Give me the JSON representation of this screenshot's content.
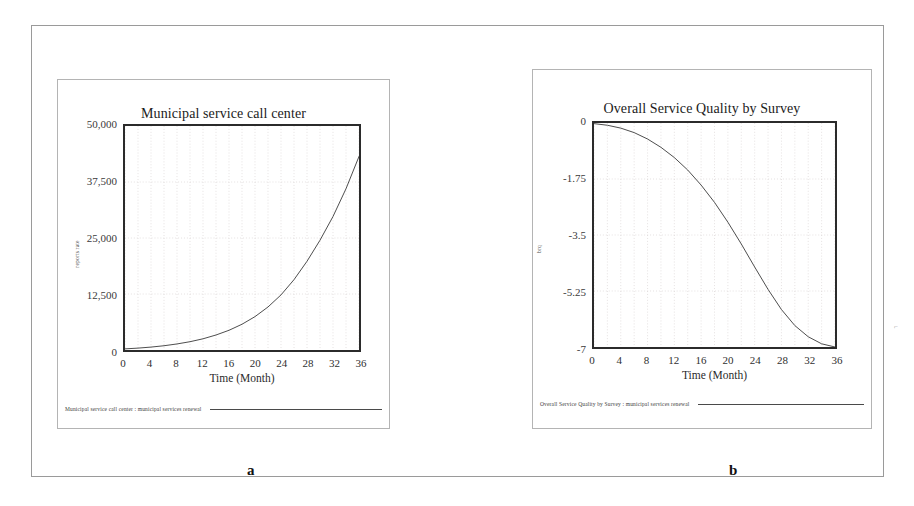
{
  "figure": {
    "caption_a": "a",
    "caption_b": "b",
    "speck": "⌐"
  },
  "chart_data": [
    {
      "id": "a",
      "type": "line",
      "title": "Municipal service call center",
      "xlabel": "Time (Month)",
      "ylabel": "reports rate",
      "legend": "Municipal service call center : municipal services renewal",
      "xlim": [
        0,
        36
      ],
      "ylim": [
        0,
        50000
      ],
      "xticks": [
        "0",
        "4",
        "8",
        "12",
        "16",
        "20",
        "24",
        "28",
        "32",
        "36"
      ],
      "xtick_values": [
        0,
        4,
        8,
        12,
        16,
        20,
        24,
        28,
        32,
        36
      ],
      "yticks": [
        "0",
        "12,500",
        "25,000",
        "37,500",
        "50,000"
      ],
      "ytick_values": [
        0,
        12500,
        25000,
        37500,
        50000
      ],
      "grid": true,
      "legend_position": "below-axes",
      "series": [
        {
          "name": "municipal services renewal",
          "color": "#3a3a3a",
          "x": [
            0,
            2,
            4,
            6,
            8,
            10,
            12,
            14,
            16,
            18,
            20,
            22,
            24,
            26,
            28,
            30,
            32,
            34,
            36
          ],
          "values": [
            250,
            420,
            650,
            950,
            1350,
            1850,
            2500,
            3350,
            4400,
            5750,
            7450,
            9600,
            12300,
            15700,
            19800,
            24500,
            29800,
            36000,
            43200
          ]
        }
      ]
    },
    {
      "id": "b",
      "type": "line",
      "title": "Overall Service Quality by Survey",
      "xlabel": "Time (Month)",
      "ylabel": "brq",
      "legend": "Overall Service Quality by Survey : municipal services renewal",
      "xlim": [
        0,
        36
      ],
      "ylim": [
        -7,
        0
      ],
      "xticks": [
        "0",
        "4",
        "8",
        "12",
        "16",
        "20",
        "24",
        "28",
        "32",
        "36"
      ],
      "xtick_values": [
        0,
        4,
        8,
        12,
        16,
        20,
        24,
        28,
        32,
        36
      ],
      "yticks": [
        "-7",
        "-5.25",
        "-3.5",
        "-1.75",
        "0"
      ],
      "ytick_values": [
        -7,
        -5.25,
        -3.5,
        -1.75,
        0
      ],
      "grid": true,
      "legend_position": "below-axes",
      "series": [
        {
          "name": "municipal services renewal",
          "color": "#3a3a3a",
          "x": [
            0,
            2,
            4,
            6,
            8,
            10,
            12,
            14,
            16,
            18,
            20,
            22,
            24,
            26,
            28,
            30,
            32,
            34,
            36
          ],
          "values": [
            -0.02,
            -0.07,
            -0.16,
            -0.3,
            -0.5,
            -0.76,
            -1.08,
            -1.47,
            -1.94,
            -2.48,
            -3.1,
            -3.78,
            -4.5,
            -5.2,
            -5.83,
            -6.33,
            -6.68,
            -6.9,
            -7.0
          ]
        }
      ]
    }
  ]
}
